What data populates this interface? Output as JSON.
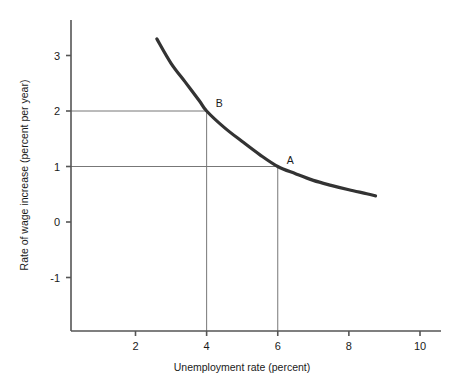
{
  "chart_data": {
    "type": "line",
    "title": "",
    "subtitle": "",
    "xlabel": "Unemployment rate (percent)",
    "ylabel": "Rate of wage increase (percent per year)",
    "xlim": [
      0,
      10.6
    ],
    "ylim": [
      -1.9,
      3.6
    ],
    "xticks": [
      2,
      4,
      6,
      8,
      10
    ],
    "xticklabels": [
      "2",
      "4",
      "6",
      "8",
      "10"
    ],
    "yticks": [
      3,
      2,
      1,
      0,
      -1
    ],
    "yticklabels": [
      "3",
      "2",
      "1",
      "0",
      "-1"
    ],
    "grid": false,
    "legend": null,
    "series": [
      {
        "name": "Phillips curve",
        "color": "#333333",
        "x": [
          2.6,
          3.0,
          3.4,
          3.8,
          4.0,
          4.5,
          5.0,
          5.5,
          6.0,
          6.5,
          7.0,
          7.5,
          8.0,
          8.5,
          8.75
        ],
        "y": [
          3.3,
          2.86,
          2.52,
          2.18,
          2.0,
          1.7,
          1.45,
          1.21,
          1.0,
          0.87,
          0.75,
          0.66,
          0.58,
          0.51,
          0.47
        ]
      }
    ],
    "annotations": [
      {
        "label": "A",
        "x": 6,
        "y": 1,
        "dropline": true,
        "leftline": true
      },
      {
        "label": "B",
        "x": 4,
        "y": 2,
        "dropline": true,
        "leftline": true
      }
    ]
  },
  "axes": {
    "x_title": "Unemployment rate (percent)",
    "y_title": "Rate of wage increase (percent per year)",
    "x_tick_labels": [
      "2",
      "4",
      "6",
      "8",
      "10"
    ],
    "y_tick_labels": [
      "3",
      "2",
      "1",
      "0",
      "-1"
    ]
  },
  "points": {
    "a_label": "A",
    "b_label": "B"
  },
  "colors": {
    "curve": "#333333",
    "axis": "#555555",
    "guide": "#777777",
    "text": "#1a1a1a",
    "background": "#ffffff"
  }
}
